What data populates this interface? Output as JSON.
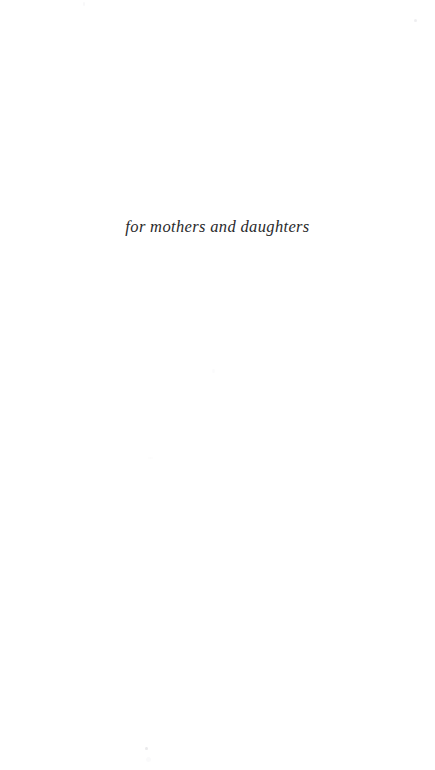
{
  "page": {
    "kind": "book-dedication-page",
    "background_color": "#ffffff",
    "width": 435,
    "height": 770
  },
  "dedication": {
    "text": "for mothers and daughters",
    "style": "italic",
    "alignment": "center",
    "text_color": "#2a2a2c"
  },
  "artifacts": {
    "description": "faint scan specks on paper",
    "color": "#d9d9dd"
  }
}
